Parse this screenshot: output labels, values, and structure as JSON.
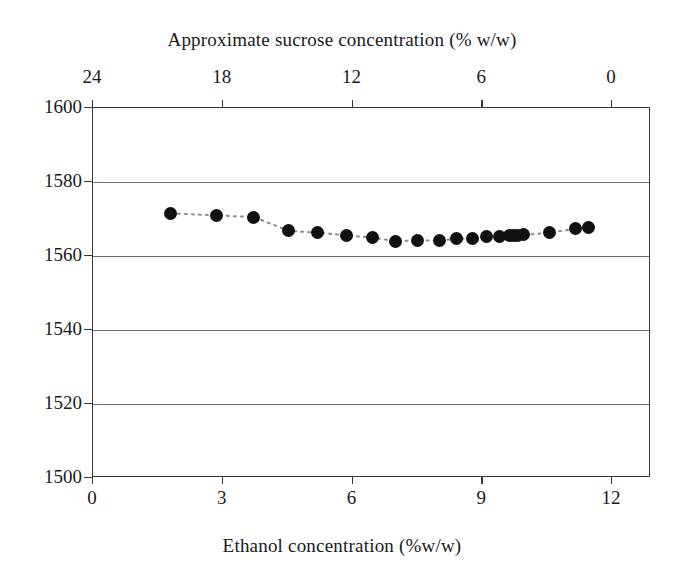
{
  "chart_data": {
    "type": "scatter",
    "title": "",
    "xlabel": "Ethanol concentration (%w/w)",
    "ylabel": "",
    "secondary_xlabel": "Approximate sucrose concentration (% w/w)",
    "xlim": [
      0,
      12.9
    ],
    "ylim": [
      1500,
      1600
    ],
    "secondary_xlim": [
      24,
      0
    ],
    "xticks": [
      0,
      3,
      6,
      9,
      12
    ],
    "xticklabels": [
      "0",
      "3",
      "6",
      "9",
      "12"
    ],
    "yticks": [
      1500,
      1520,
      1540,
      1560,
      1580,
      1600
    ],
    "yticklabels": [
      "1500",
      "1520",
      "1540",
      "1560",
      "1580",
      "1600"
    ],
    "secondary_xticks": [
      24,
      18,
      12,
      6,
      0
    ],
    "secondary_xticklabels": [
      "24",
      "18",
      "12",
      "6",
      "0"
    ],
    "grid": "horizontal",
    "legend": "none",
    "marker": "filled-circle",
    "marker_color": "#111111",
    "line_style": "dotted",
    "line_color": "#8c8c8c",
    "series": [
      {
        "name": "sound velocity",
        "x": [
          1.8,
          2.85,
          3.72,
          4.52,
          5.2,
          5.85,
          6.45,
          7.0,
          7.5,
          8.0,
          8.4,
          8.78,
          9.1,
          9.4,
          9.62,
          9.72,
          9.82,
          9.95,
          10.55,
          11.15,
          11.45
        ],
        "y": [
          1571.5,
          1571.0,
          1570.5,
          1566.8,
          1566.3,
          1565.6,
          1565.0,
          1564.0,
          1564.2,
          1564.2,
          1564.6,
          1564.8,
          1565.2,
          1565.4,
          1565.5,
          1565.6,
          1565.6,
          1565.7,
          1566.3,
          1567.3,
          1567.6
        ]
      }
    ]
  }
}
